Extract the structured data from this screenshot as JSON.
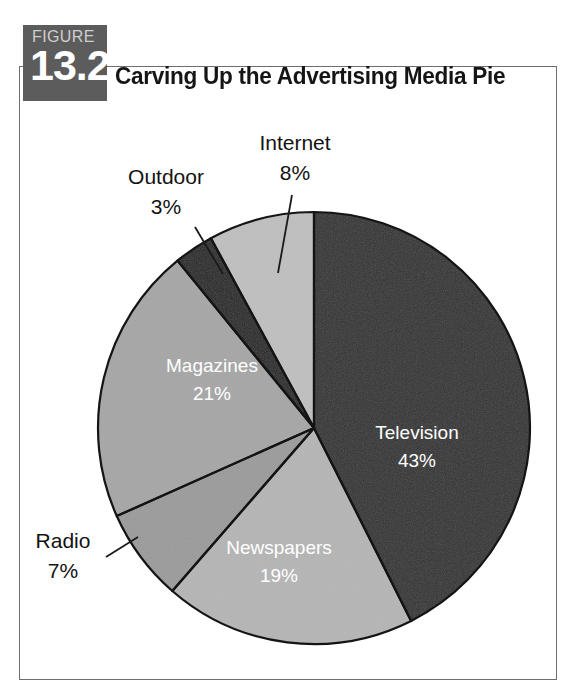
{
  "figure": {
    "label_word": "FIGURE",
    "number": "13.2",
    "title": "Carving Up the Advertising Media Pie"
  },
  "colors": {
    "badge_background": "#5c5c5c",
    "badge_word": "#cfcfcf",
    "badge_number": "#ffffff",
    "frame_border": "#6e6e6e",
    "title_text": "#151515",
    "page_background": "#ffffff",
    "slice_outline": "#141414",
    "label_inside": "#ffffff",
    "label_outside": "#121212",
    "leader_line": "#1a1a1a"
  },
  "chart_data": {
    "type": "pie",
    "title": "Carving Up the Advertising Media Pie",
    "xlabel": "",
    "ylabel": "",
    "start_angle_deg": 0,
    "direction": "clockwise",
    "legend": "none",
    "grid": false,
    "categories": [
      "Television",
      "Newspapers",
      "Radio",
      "Magazines",
      "Outdoor",
      "Internet"
    ],
    "values": [
      43,
      19,
      7,
      21,
      3,
      8
    ],
    "unit": "%",
    "slices": [
      {
        "name": "Television",
        "value": 43,
        "value_label": "43%",
        "color": "#333333",
        "label_placement": "inside",
        "label_color": "#ffffff"
      },
      {
        "name": "Newspapers",
        "value": 19,
        "value_label": "19%",
        "color": "#b5b5b5",
        "label_placement": "inside",
        "label_color": "#ffffff"
      },
      {
        "name": "Radio",
        "value": 7,
        "value_label": "7%",
        "color": "#9b9b9b",
        "label_placement": "outside",
        "label_color": "#121212"
      },
      {
        "name": "Magazines",
        "value": 21,
        "value_label": "21%",
        "color": "#a6a6a6",
        "label_placement": "inside",
        "label_color": "#ffffff"
      },
      {
        "name": "Outdoor",
        "value": 3,
        "value_label": "3%",
        "color": "#262626",
        "label_placement": "outside",
        "label_color": "#121212"
      },
      {
        "name": "Internet",
        "value": 8,
        "value_label": "8%",
        "color": "#bfbfbf",
        "label_placement": "outside",
        "label_color": "#121212"
      }
    ]
  },
  "labels": {
    "television_name": "Television",
    "television_value": "43%",
    "newspapers_name": "Newspapers",
    "newspapers_value": "19%",
    "radio_name": "Radio",
    "radio_value": "7%",
    "magazines_name": "Magazines",
    "magazines_value": "21%",
    "outdoor_name": "Outdoor",
    "outdoor_value": "3%",
    "internet_name": "Internet",
    "internet_value": "8%"
  }
}
